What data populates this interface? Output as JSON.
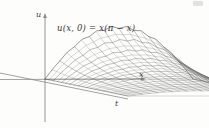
{
  "figure": {
    "kind": "3d-surface-wireframe",
    "caption_formula": "u(x, 0) = x(π − x)",
    "axes": {
      "vertical": {
        "name": "u",
        "label": "u"
      },
      "horizontal_right": {
        "name": "x",
        "label": "x"
      },
      "depth": {
        "name": "t",
        "label": "t"
      }
    },
    "background_color": "#fdfdfc",
    "line_color": "#4a4a4a",
    "axis_color": "#7a7a7a",
    "text_color": "#3a3a3a"
  },
  "chart_data": {
    "type": "line",
    "title": "u(x, 0) = x(π − x)",
    "xlabel": "x",
    "ylabel": "u",
    "zlabel": "t",
    "grid": false,
    "legend": "none",
    "xlim": [
      0,
      3.14159
    ],
    "ylim": [
      0,
      2.47
    ],
    "tlim": [
      0,
      1.0
    ],
    "x": [
      0,
      0.3142,
      0.6283,
      0.9425,
      1.2566,
      1.5708,
      1.885,
      2.1991,
      2.5133,
      2.8274,
      3.1416
    ],
    "series": [
      {
        "name": "t = 0.00",
        "values": [
          0,
          0.8883,
          1.5791,
          2.0726,
          2.3687,
          2.4674,
          2.3687,
          2.0726,
          1.5791,
          0.8883,
          0
        ]
      },
      {
        "name": "t = 0.10",
        "values": [
          0,
          0.6945,
          1.2374,
          1.6251,
          1.858,
          1.9359,
          1.858,
          1.6251,
          1.2374,
          0.6945,
          0
        ]
      },
      {
        "name": "t = 0.20",
        "values": [
          0,
          0.5463,
          0.9749,
          1.2816,
          1.4661,
          1.5278,
          1.4661,
          1.2816,
          0.9749,
          0.5463,
          0
        ]
      },
      {
        "name": "t = 0.30",
        "values": [
          0,
          0.4318,
          0.772,
          1.0156,
          1.1622,
          1.2113,
          1.1622,
          1.0156,
          0.772,
          0.4318,
          0
        ]
      },
      {
        "name": "t = 0.40",
        "values": [
          0,
          0.3427,
          0.6136,
          0.8074,
          0.924,
          0.9631,
          0.924,
          0.8074,
          0.6136,
          0.3427,
          0
        ]
      },
      {
        "name": "t = 0.50",
        "values": [
          0,
          0.2727,
          0.4885,
          0.6429,
          0.7358,
          0.767,
          0.7358,
          0.6429,
          0.4885,
          0.2727,
          0
        ]
      },
      {
        "name": "t = 0.60",
        "values": [
          0,
          0.2174,
          0.3895,
          0.5126,
          0.5868,
          0.6117,
          0.5868,
          0.5126,
          0.3895,
          0.2174,
          0
        ]
      },
      {
        "name": "t = 0.70",
        "values": [
          0,
          0.1735,
          0.3108,
          0.4091,
          0.4683,
          0.4882,
          0.4683,
          0.4091,
          0.3108,
          0.1735,
          0
        ]
      },
      {
        "name": "t = 0.80",
        "values": [
          0,
          0.1385,
          0.2481,
          0.3266,
          0.3739,
          0.3898,
          0.3739,
          0.3266,
          0.2481,
          0.1385,
          0
        ]
      },
      {
        "name": "t = 0.90",
        "values": [
          0,
          0.1106,
          0.1982,
          0.2609,
          0.2987,
          0.3114,
          0.2987,
          0.2609,
          0.1982,
          0.1106,
          0
        ]
      },
      {
        "name": "t = 1.00",
        "values": [
          0,
          0.0884,
          0.1584,
          0.2085,
          0.2387,
          0.2489,
          0.2387,
          0.2085,
          0.1584,
          0.0884,
          0
        ]
      }
    ]
  }
}
